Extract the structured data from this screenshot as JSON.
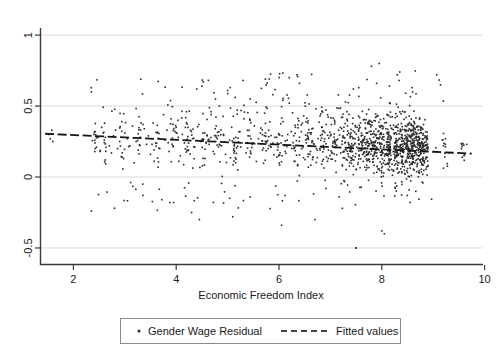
{
  "chart_data": {
    "type": "scatter",
    "title": "",
    "xlabel": "Economic Freedom Index",
    "ylabel": "",
    "xlim": [
      1.35,
      9.95
    ],
    "ylim": [
      -0.62,
      1.05
    ],
    "xticks": [
      2,
      4,
      6,
      8,
      10
    ],
    "xticklabels": [
      "2",
      "4",
      "6",
      "8",
      "10"
    ],
    "yticks": [
      1,
      0.5,
      0,
      -0.5
    ],
    "yticklabels": [
      "1",
      ".5",
      "0",
      "-.5"
    ],
    "ytick_display": [
      "1",
      "0.5",
      "0",
      "-0.5"
    ],
    "grid": "horizontal",
    "grid_color": "#d9d9d9",
    "axis_color": "#3a3a3a",
    "legend_position": "below-center",
    "marker_color": "#2b2b2b",
    "marker_size": 1.6,
    "line_color": "#151515",
    "series": [
      {
        "name": "Gender Wage Residual",
        "type": "scatter",
        "marker": "dot",
        "points": [
          [
            1.52,
            0.3
          ],
          [
            1.55,
            0.27
          ],
          [
            1.58,
            0.33
          ],
          [
            1.6,
            0.25
          ],
          [
            2.35,
            0.6
          ],
          [
            2.4,
            0.3
          ],
          [
            2.42,
            0.24
          ],
          [
            2.45,
            0.21
          ],
          [
            2.48,
            0.28
          ],
          [
            2.52,
            0.18
          ],
          [
            2.55,
            0.35
          ],
          [
            2.58,
            0.31
          ],
          [
            2.6,
            0.26
          ],
          [
            2.62,
            0.12
          ],
          [
            2.7,
            0.22
          ],
          [
            2.74,
            0.17
          ],
          [
            2.78,
            0.29
          ],
          [
            2.82,
            0.33
          ],
          [
            2.86,
            0.2
          ],
          [
            2.9,
            0.25
          ],
          [
            2.95,
            0.14
          ],
          [
            3.0,
            0.31
          ],
          [
            3.05,
            0.27
          ],
          [
            3.1,
            0.22
          ],
          [
            3.15,
            0.36
          ],
          [
            3.18,
            0.1
          ],
          [
            3.22,
            0.25
          ],
          [
            3.26,
            0.19
          ],
          [
            3.3,
            0.28
          ],
          [
            3.35,
            -0.05
          ],
          [
            3.38,
            0.34
          ],
          [
            3.42,
            0.23
          ],
          [
            3.46,
            0.29
          ],
          [
            3.5,
            0.16
          ],
          [
            3.55,
            0.38
          ],
          [
            3.6,
            0.24
          ],
          [
            3.64,
            0.31
          ],
          [
            3.68,
            0.2
          ],
          [
            3.72,
            -0.16
          ],
          [
            3.78,
            0.26
          ],
          [
            3.82,
            0.33
          ],
          [
            3.86,
            0.18
          ],
          [
            3.9,
            0.41
          ],
          [
            3.94,
            0.22
          ],
          [
            4.0,
            0.35
          ],
          [
            4.04,
            0.28
          ],
          [
            4.08,
            0.15
          ],
          [
            4.12,
            0.3
          ],
          [
            4.16,
            0.24
          ],
          [
            4.2,
            0.46
          ],
          [
            4.24,
            0.19
          ],
          [
            4.28,
            0.33
          ],
          [
            4.32,
            0.27
          ],
          [
            4.36,
            0.21
          ],
          [
            4.4,
            0.62
          ],
          [
            4.44,
            0.37
          ],
          [
            4.48,
            0.25
          ],
          [
            4.52,
            0.31
          ],
          [
            4.56,
            0.13
          ],
          [
            4.6,
            0.29
          ],
          [
            4.64,
            0.23
          ],
          [
            4.68,
            0.44
          ],
          [
            4.72,
            0.18
          ],
          [
            4.76,
            0.34
          ],
          [
            4.8,
            0.27
          ],
          [
            4.84,
            0.5
          ],
          [
            4.88,
            0.22
          ],
          [
            4.92,
            0.3
          ],
          [
            4.96,
            0.16
          ],
          [
            5.0,
            0.61
          ],
          [
            5.04,
            0.26
          ],
          [
            5.08,
            0.35
          ],
          [
            5.12,
            0.2
          ],
          [
            5.16,
            0.28
          ],
          [
            5.2,
            0.05
          ],
          [
            5.24,
            0.32
          ],
          [
            5.28,
            0.24
          ],
          [
            5.32,
            0.41
          ],
          [
            5.36,
            0.17
          ],
          [
            5.4,
            0.29
          ],
          [
            5.44,
            0.55
          ],
          [
            5.48,
            0.23
          ],
          [
            5.52,
            0.36
          ],
          [
            5.56,
            0.11
          ],
          [
            5.6,
            0.27
          ],
          [
            5.64,
            0.31
          ],
          [
            5.68,
            0.19
          ],
          [
            5.72,
            0.45
          ],
          [
            5.76,
            0.25
          ],
          [
            5.8,
            0.33
          ],
          [
            5.84,
            0.21
          ],
          [
            5.88,
            0.58
          ],
          [
            5.92,
            0.28
          ],
          [
            5.96,
            0.14
          ],
          [
            6.0,
            0.3
          ],
          [
            6.04,
            0.24
          ],
          [
            6.08,
            0.39
          ],
          [
            6.12,
            0.18
          ],
          [
            6.16,
            0.26
          ],
          [
            6.2,
            0.52
          ],
          [
            6.24,
            0.32
          ],
          [
            6.28,
            0.22
          ],
          [
            6.32,
            0.35
          ],
          [
            6.36,
            0.08
          ],
          [
            6.4,
            0.28
          ],
          [
            6.44,
            0.2
          ],
          [
            6.48,
            0.43
          ],
          [
            6.52,
            0.26
          ],
          [
            6.56,
            0.31
          ],
          [
            6.6,
            0.16
          ],
          [
            6.64,
            0.34
          ],
          [
            6.68,
            0.23
          ],
          [
            6.72,
            0.48
          ],
          [
            6.76,
            0.27
          ],
          [
            6.8,
            0.19
          ],
          [
            6.84,
            0.3
          ],
          [
            6.88,
            0.25
          ],
          [
            6.92,
            0.37
          ],
          [
            6.96,
            0.13
          ],
          [
            7.0,
            0.29
          ],
          [
            7.04,
            0.22
          ],
          [
            7.08,
            0.4
          ],
          [
            7.12,
            0.26
          ],
          [
            7.16,
            0.33
          ],
          [
            7.2,
            0.17
          ],
          [
            7.24,
            0.28
          ],
          [
            7.28,
            0.24
          ],
          [
            7.32,
            0.46
          ],
          [
            7.36,
            0.21
          ],
          [
            7.4,
            0.31
          ],
          [
            7.44,
            0.15
          ],
          [
            7.48,
            0.27
          ],
          [
            7.52,
            0.35
          ],
          [
            7.56,
            0.23
          ],
          [
            7.6,
            0.29
          ],
          [
            7.64,
            0.11
          ],
          [
            7.68,
            0.38
          ],
          [
            7.72,
            0.25
          ],
          [
            7.76,
            0.32
          ],
          [
            7.8,
            0.2
          ],
          [
            7.84,
            0.28
          ],
          [
            7.88,
            0.42
          ],
          [
            7.92,
            0.24
          ],
          [
            7.96,
            0.3
          ],
          [
            8.0,
            0.18
          ],
          [
            8.04,
            0.26
          ],
          [
            8.08,
            0.34
          ],
          [
            8.12,
            0.22
          ],
          [
            8.16,
            0.29
          ],
          [
            8.2,
            0.09
          ],
          [
            8.24,
            0.31
          ],
          [
            8.28,
            0.25
          ],
          [
            8.32,
            0.37
          ],
          [
            8.36,
            0.2
          ],
          [
            8.4,
            0.27
          ],
          [
            8.44,
            0.23
          ],
          [
            8.48,
            0.33
          ],
          [
            8.52,
            0.16
          ],
          [
            8.56,
            0.28
          ],
          [
            8.6,
            0.24
          ],
          [
            8.64,
            0.3
          ],
          [
            8.68,
            0.19
          ],
          [
            8.72,
            0.26
          ],
          [
            8.76,
            0.35
          ],
          [
            8.8,
            0.21
          ],
          [
            8.84,
            0.29
          ],
          [
            9.2,
            0.22
          ],
          [
            9.24,
            0.27
          ],
          [
            9.3,
            0.17
          ],
          [
            9.55,
            0.2
          ],
          [
            9.6,
            0.15
          ],
          [
            9.65,
            0.23
          ],
          [
            7.5,
            -0.5
          ],
          [
            8.0,
            -0.38
          ],
          [
            6.7,
            -0.3
          ],
          [
            5.1,
            -0.28
          ],
          [
            2.8,
            -0.22
          ],
          [
            4.3,
            -0.25
          ],
          [
            3.95,
            -0.18
          ],
          [
            7.8,
            0.78
          ],
          [
            8.3,
            0.72
          ],
          [
            7.9,
            0.66
          ],
          [
            6.2,
            0.7
          ],
          [
            5.3,
            0.68
          ],
          [
            4.5,
            0.64
          ],
          [
            8.6,
            0.6
          ]
        ],
        "n_points_approx": 1200,
        "clusters_note": "Dense vertical stacks per country; heaviest mass between x=7.4 and x=8.9, y between 0.0 and 0.45"
      },
      {
        "name": "Fitted values",
        "type": "line",
        "style": "dashed-solid",
        "x_start": 1.45,
        "y_start": 0.305,
        "x_end": 9.75,
        "y_end": 0.165,
        "slope": -0.0169,
        "intercept": 0.3295
      }
    ]
  },
  "legend": {
    "entries": [
      {
        "label": "Gender Wage Residual",
        "marker": "dot"
      },
      {
        "label": "Fitted values",
        "marker": "dashed-line"
      }
    ]
  },
  "axes": {
    "x_title": "Economic Freedom Index",
    "x_tick_labels": [
      "2",
      "4",
      "6",
      "8",
      "10"
    ],
    "y_tick_labels": [
      "1",
      "0.5",
      "0",
      "-0.5"
    ]
  },
  "colors": {
    "background": "#ffffff",
    "marker": "#2b2b2b",
    "gridline": "#d9d9d9",
    "axis": "#3a3a3a",
    "fit_line": "#151515",
    "legend_border": "#8a8a8a"
  }
}
